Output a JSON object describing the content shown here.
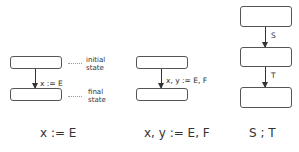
{
  "diagrams": [
    {
      "name": "assignment",
      "edge_label": "x := E",
      "caption": "x := E",
      "annotations": {
        "initial": "initial\nstate",
        "final": "final\nstate"
      }
    },
    {
      "name": "simultaneous-assignment",
      "edge_label": "x, y := E, F",
      "caption": "x, y := E, F"
    },
    {
      "name": "sequential-composition",
      "edge_labels": [
        "S",
        "T"
      ],
      "caption": "S ; T"
    }
  ]
}
